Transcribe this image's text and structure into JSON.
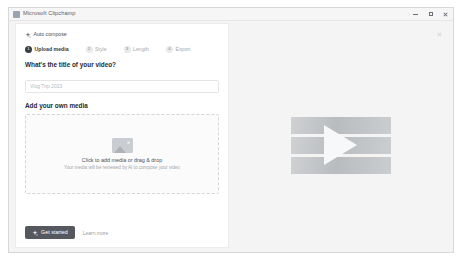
{
  "window": {
    "title": "Microsoft Clipchamp",
    "app_icon": "clipchamp-icon",
    "controls": {
      "minimize": "minimize-button",
      "maximize": "maximize-button",
      "close": "close-button"
    }
  },
  "left_panel": {
    "auto_compose": {
      "icon": "sparkle-icon",
      "label": "Auto compose"
    },
    "stepper": [
      {
        "num": "1",
        "label": "Upload media",
        "active": true
      },
      {
        "num": "2",
        "label": "Style",
        "active": false
      },
      {
        "num": "3",
        "label": "Length",
        "active": false
      },
      {
        "num": "4",
        "label": "Export",
        "active": false
      }
    ],
    "title_section": {
      "heading": "What's the title of your video?",
      "input_value": "",
      "input_placeholder": "Vlog Trip 2023"
    },
    "media_section": {
      "heading": "Add your own media",
      "dropzone": {
        "icon": "image-placeholder-icon",
        "title": "Click to add media or drag & drop",
        "subtitle": "Your media will be reviewed by AI to compose your video"
      }
    },
    "footer": {
      "primary_button": {
        "icon": "sparkle-icon",
        "label": "Get started"
      },
      "secondary_link": "Learn more"
    }
  },
  "right_panel": {
    "close_icon": "close-icon",
    "preview": {
      "play_icon": "play-triangle-icon",
      "strips": 3
    }
  },
  "colors": {
    "accent_button": "#55585e",
    "step_active": "#3a3d42",
    "panel_bg": "#f4f4f5",
    "card_bg": "#ffffff"
  }
}
